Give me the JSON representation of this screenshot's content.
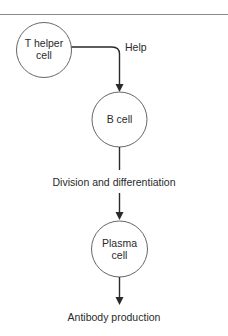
{
  "diagram": {
    "type": "flowchart",
    "nodes": [
      {
        "id": "t_helper",
        "label_line1": "T helper",
        "label_line2": "cell",
        "shape": "circle"
      },
      {
        "id": "b_cell",
        "label_line1": "B cell",
        "shape": "circle"
      },
      {
        "id": "plasma",
        "label_line1": "Plasma",
        "label_line2": "cell",
        "shape": "circle"
      }
    ],
    "edges": [
      {
        "from": "t_helper",
        "to": "b_cell",
        "label": "Help"
      },
      {
        "from": "b_cell",
        "to": "plasma",
        "label": "Division and differentiation"
      },
      {
        "from": "plasma",
        "to": "output",
        "label": "Antibody production"
      }
    ]
  },
  "labels": {
    "help": "Help",
    "division": "Division and differentiation",
    "antibody": "Antibody production"
  },
  "colors": {
    "stroke": "#2a2a2a",
    "circle_stroke": "#555555",
    "rule": "#8a8a8a"
  }
}
